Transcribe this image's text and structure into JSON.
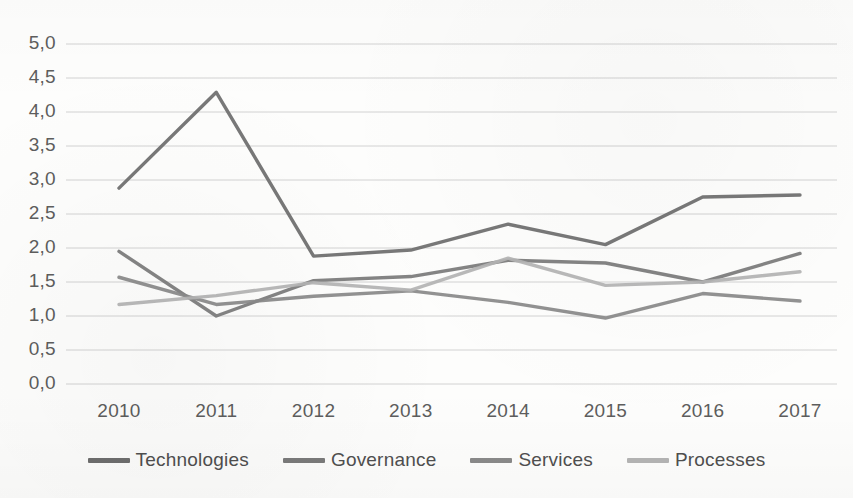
{
  "chart_data": {
    "type": "line",
    "title": "",
    "subtitle": "",
    "xlabel": "",
    "ylabel": "",
    "categories": [
      "2010",
      "2011",
      "2012",
      "2013",
      "2014",
      "2015",
      "2016",
      "2017"
    ],
    "x_tick_labels": [
      "2010",
      "2011",
      "2012",
      "2013",
      "2014",
      "2015",
      "2016",
      "2017"
    ],
    "y_tick_labels": [
      "0,0",
      "0,5",
      "1,0",
      "1,5",
      "2,0",
      "2,5",
      "3,0",
      "3,5",
      "4,0",
      "4,5",
      "5,0"
    ],
    "y_tick_values": [
      0.0,
      0.5,
      1.0,
      1.5,
      2.0,
      2.5,
      3.0,
      3.5,
      4.0,
      4.5,
      5.0
    ],
    "ylim": [
      0.0,
      5.0
    ],
    "grid": "horizontal",
    "legend_position": "bottom",
    "decimal_separator": ",",
    "series": [
      {
        "name": "Technologies",
        "color": "#6e6e6e",
        "values": [
          2.88,
          4.29,
          1.88,
          1.97,
          2.35,
          2.05,
          2.75,
          2.78
        ]
      },
      {
        "name": "Governance",
        "color": "#7b7b7b",
        "values": [
          1.95,
          1.0,
          1.52,
          1.58,
          1.82,
          1.78,
          1.5,
          1.92
        ]
      },
      {
        "name": "Services",
        "color": "#8a8a8a",
        "values": [
          1.57,
          1.17,
          1.29,
          1.37,
          1.2,
          0.97,
          1.33,
          1.22
        ]
      },
      {
        "name": "Processes",
        "color": "#b4b4b4",
        "values": [
          1.17,
          1.3,
          1.49,
          1.38,
          1.85,
          1.45,
          1.5,
          1.65
        ]
      }
    ]
  },
  "legend": {
    "items": [
      {
        "label": "Technologies",
        "color": "#6e6e6e"
      },
      {
        "label": "Governance",
        "color": "#7b7b7b"
      },
      {
        "label": "Services",
        "color": "#8a8a8a"
      },
      {
        "label": "Processes",
        "color": "#b4b4b4"
      }
    ]
  },
  "axes": {
    "grid_color": "#d2d2d2",
    "tick_label_color": "#5d5d5d"
  }
}
